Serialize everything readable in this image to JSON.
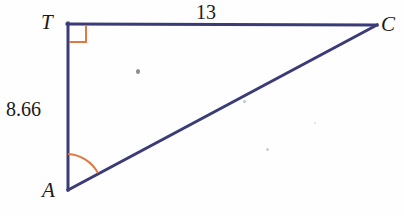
{
  "figure": {
    "kind": "right-triangle-diagram",
    "background_color": "#fefefe",
    "line_color": "#3b3b78",
    "marker_color": "#e0783f",
    "label_color": "#1a1a1a",
    "stroke_width": 3,
    "vertices": [
      {
        "name": "T",
        "label": "T",
        "x": 68,
        "y": 24,
        "label_x": 41,
        "label_y": 12
      },
      {
        "name": "C",
        "label": "C",
        "x": 377,
        "y": 25,
        "label_x": 381,
        "label_y": 14
      },
      {
        "name": "A",
        "label": "A",
        "x": 68,
        "y": 190,
        "label_x": 42,
        "label_y": 180
      }
    ],
    "sides": [
      {
        "name": "TC",
        "from": "T",
        "to": "C",
        "label": "13",
        "label_x": 196,
        "label_y": 2
      },
      {
        "name": "TA",
        "from": "T",
        "to": "A",
        "label": "8.66",
        "label_x": 6,
        "label_y": 99
      },
      {
        "name": "AC",
        "from": "A",
        "to": "C",
        "label": ""
      }
    ],
    "angle_markers": [
      {
        "name": "right-angle-at-T",
        "at_vertex": "T",
        "type": "square",
        "size": 18,
        "color": "#e0783f"
      },
      {
        "name": "angle-arc-at-A",
        "at_vertex": "A",
        "type": "arc",
        "radius": 36,
        "color": "#e0783f"
      }
    ],
    "artifacts": [
      {
        "name": "scan-speck-1",
        "x": 136,
        "y": 69
      },
      {
        "name": "scan-speck-2",
        "x": 243,
        "y": 100
      },
      {
        "name": "scan-speck-3",
        "x": 266,
        "y": 148
      },
      {
        "name": "scan-speck-4",
        "x": 314,
        "y": 122
      }
    ]
  }
}
